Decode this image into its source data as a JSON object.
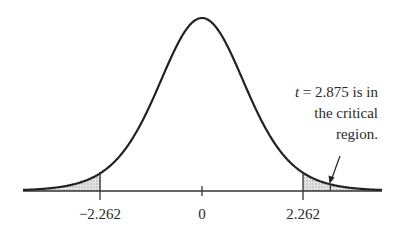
{
  "chart_data": {
    "type": "area",
    "title": "",
    "xlabel": "",
    "ylabel": "",
    "x_ticks": [
      {
        "value": -2.262,
        "label": "−2.262"
      },
      {
        "value": 0,
        "label": "0"
      },
      {
        "value": 2.262,
        "label": "2.262"
      }
    ],
    "critical_values": [
      -2.262,
      2.262
    ],
    "shaded_regions": [
      {
        "from": "-inf",
        "to": -2.262,
        "name": "left critical region"
      },
      {
        "from": 2.262,
        "to": "inf",
        "name": "right critical region"
      }
    ],
    "test_statistic": {
      "name": "t",
      "value": 2.875
    },
    "annotation": {
      "lines": [
        "t = 2.875 is in",
        "the critical",
        "region."
      ],
      "points_to": 2.875
    },
    "grid": false,
    "legend": null,
    "colors": {
      "curve": "#222222",
      "shade": "#c8c8c8",
      "axis": "#333333"
    }
  },
  "labels": {
    "tick_neg": "−2.262",
    "tick_zero": "0",
    "tick_pos": "2.262",
    "annotation_var": "t",
    "annotation_line1_rest": " = 2.875 is in",
    "annotation_line2": "the critical",
    "annotation_line3": "region."
  }
}
